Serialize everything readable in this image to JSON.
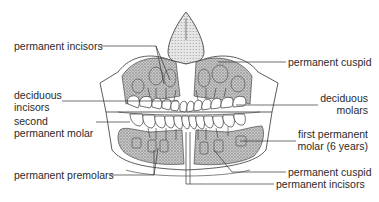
{
  "diagram": {
    "colors": {
      "line": "#333333",
      "bone_stipple": "#9a9a9a",
      "tooth_fill": "#ffffff",
      "background": "#ffffff"
    },
    "labels_left": [
      {
        "id": "permanent-incisors-top",
        "lines": [
          "permanent incisors"
        ]
      },
      {
        "id": "deciduous-incisors",
        "lines": [
          "deciduous",
          "incisors"
        ]
      },
      {
        "id": "second-permanent-molar",
        "lines": [
          "second",
          "permanent molar"
        ]
      },
      {
        "id": "permanent-premolars",
        "lines": [
          "permanent premolars"
        ]
      }
    ],
    "labels_right": [
      {
        "id": "permanent-cuspid-top",
        "lines": [
          "permanent cuspid"
        ]
      },
      {
        "id": "deciduous-molars",
        "lines": [
          "deciduous",
          "molars"
        ]
      },
      {
        "id": "first-permanent-molar",
        "lines": [
          "first permanent",
          "molar (6 years)"
        ]
      },
      {
        "id": "permanent-cuspid-bottom",
        "lines": [
          "permanent cuspid"
        ]
      },
      {
        "id": "permanent-incisors-bottom",
        "lines": [
          "permanent incisors"
        ]
      }
    ]
  }
}
